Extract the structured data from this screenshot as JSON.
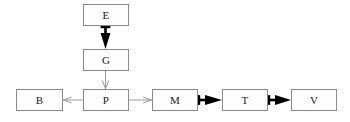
{
  "diagram": {
    "type": "flow-diagram",
    "width": 350,
    "height": 122,
    "background_color": "#ffffff",
    "box_border_color": "#8a8a8a",
    "box_fill_color": "#fefefe",
    "label_color": "#1a1a1a",
    "thick_edge_color": "#000000",
    "thin_edge_color": "#9a9a9a",
    "nodes": [
      {
        "id": "E",
        "label": "E",
        "x": 83,
        "y": 4,
        "width": 46,
        "height": 22
      },
      {
        "id": "G",
        "label": "G",
        "x": 83,
        "y": 49,
        "width": 46,
        "height": 22
      },
      {
        "id": "B",
        "label": "B",
        "x": 16,
        "y": 89,
        "width": 47,
        "height": 22
      },
      {
        "id": "P",
        "label": "P",
        "x": 83,
        "y": 89,
        "width": 46,
        "height": 22
      },
      {
        "id": "M",
        "label": "M",
        "x": 152,
        "y": 89,
        "width": 46,
        "height": 22
      },
      {
        "id": "T",
        "label": "T",
        "x": 222,
        "y": 89,
        "width": 46,
        "height": 22
      },
      {
        "id": "V",
        "label": "V",
        "x": 291,
        "y": 89,
        "width": 46,
        "height": 22
      }
    ],
    "edges": [
      {
        "id": "E-to-G",
        "from": "E",
        "to": "G",
        "style": "thick-filled",
        "direction": "down",
        "color": "#000000"
      },
      {
        "id": "G-to-P",
        "from": "G",
        "to": "P",
        "style": "thin-open",
        "direction": "down",
        "color": "#9a9a9a"
      },
      {
        "id": "P-to-B",
        "from": "P",
        "to": "B",
        "style": "thin-open",
        "direction": "left",
        "color": "#9a9a9a"
      },
      {
        "id": "P-to-M",
        "from": "P",
        "to": "M",
        "style": "thin-open",
        "direction": "right",
        "color": "#9a9a9a"
      },
      {
        "id": "M-to-T",
        "from": "M",
        "to": "T",
        "style": "thick-filled",
        "direction": "right",
        "color": "#000000"
      },
      {
        "id": "T-to-V",
        "from": "T",
        "to": "V",
        "style": "thick-filled",
        "direction": "right",
        "color": "#000000"
      }
    ]
  }
}
